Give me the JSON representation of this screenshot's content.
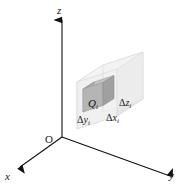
{
  "figure": {
    "name": "three-dimensional-coordinate-box-partition",
    "background_color": "#ffffff",
    "axes": {
      "z_label": "z",
      "x_label": "x",
      "y_label": "y",
      "origin_label": "O",
      "axis_color": "#1a1a1a"
    },
    "outer_box": {
      "name": "translucent-bounding-box",
      "top_face_color": "#f2f2f2",
      "left_face_color": "#e8e8e8",
      "right_face_color": "#ededed",
      "edge_color": "#dcdcdc"
    },
    "inner_cell": {
      "name": "sub-box-cell",
      "label": "Q",
      "label_subscript": "i",
      "top_face_color": "#bfbfbf",
      "left_face_color": "#a8a8a8",
      "right_face_color": "#9a9a9a",
      "edge_color": "#8a8a8a"
    },
    "dimension_labels": [
      {
        "symbol": "Δ",
        "variable": "z",
        "subscript": "i",
        "full": "Δz_i"
      },
      {
        "symbol": "Δ",
        "variable": "y",
        "subscript": "i",
        "full": "Δy_i"
      },
      {
        "symbol": "Δ",
        "variable": "x",
        "subscript": "i",
        "full": "Δx_i"
      }
    ],
    "delta_symbol": "Δ",
    "dz_var": "z",
    "dy_var": "y",
    "dx_var": "x",
    "sub_i": "i"
  }
}
